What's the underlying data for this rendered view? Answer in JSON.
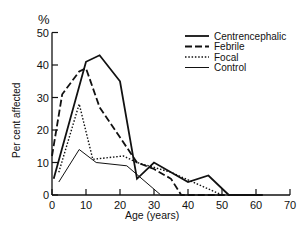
{
  "chart_data": {
    "type": "line",
    "title": "",
    "xlabel": "Age (years)",
    "ylabel": "Per cent affected",
    "y_unit_label": "%",
    "xlim": [
      0,
      70
    ],
    "ylim": [
      0,
      50
    ],
    "x_ticks": [
      0,
      10,
      20,
      30,
      40,
      50,
      60,
      70
    ],
    "y_ticks": [
      0,
      10,
      20,
      30,
      40,
      50
    ],
    "grid": false,
    "legend_position": "upper right",
    "series": [
      {
        "name": "Centrencephalic",
        "style": "solid-thick",
        "points": [
          [
            0.5,
            5
          ],
          [
            10,
            41
          ],
          [
            14,
            43
          ],
          [
            20,
            35
          ],
          [
            25,
            5
          ],
          [
            30,
            10
          ],
          [
            40,
            4
          ],
          [
            46,
            6
          ],
          [
            52,
            0
          ],
          [
            61,
            0
          ]
        ]
      },
      {
        "name": "Febrile",
        "style": "dashed",
        "points": [
          [
            0,
            12
          ],
          [
            3,
            31
          ],
          [
            8,
            38
          ],
          [
            10,
            39
          ],
          [
            14,
            27
          ],
          [
            25,
            10
          ],
          [
            30,
            8
          ],
          [
            35,
            5
          ],
          [
            38,
            0
          ],
          [
            62,
            0
          ]
        ]
      },
      {
        "name": "Focal",
        "style": "dotted",
        "points": [
          [
            2,
            7
          ],
          [
            8,
            28
          ],
          [
            12,
            11
          ],
          [
            21,
            12
          ],
          [
            25,
            10
          ],
          [
            35,
            7
          ],
          [
            50,
            0
          ]
        ]
      },
      {
        "name": "Control",
        "style": "solid-thin",
        "points": [
          [
            2,
            4
          ],
          [
            8,
            14
          ],
          [
            13,
            10
          ],
          [
            22,
            9
          ],
          [
            32,
            0
          ],
          [
            50,
            0
          ]
        ]
      }
    ]
  },
  "labels": {
    "y_unit": "%",
    "ylabel": "Per cent affected",
    "xlabel": "Age (years)",
    "legend": [
      "Centrencephalic",
      "Febrile",
      "Focal",
      "Control"
    ]
  }
}
